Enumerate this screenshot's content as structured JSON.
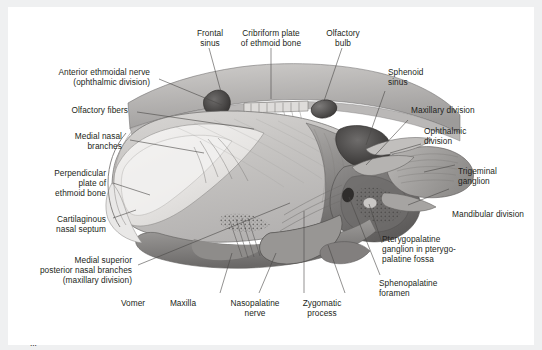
{
  "figure": {
    "type": "anatomical-illustration",
    "rendering": "grayscale medical line-and-wash drawing",
    "ink_color": "#3a3a3c",
    "line_color": "#5b5b5f",
    "page_background": "#eff0f1",
    "sheet_background": "#ffffff"
  },
  "labels": [
    {
      "id": "frontal-sinus",
      "text": "Frontal\nsinus",
      "align": "center"
    },
    {
      "id": "cribriform-plate",
      "text": "Cribriform plate\nof ethmoid bone",
      "align": "center"
    },
    {
      "id": "olfactory-bulb",
      "text": "Olfactory\nbulb",
      "align": "center"
    },
    {
      "id": "anterior-ethmoidal-nerve",
      "text": "Anterior ethmoidal nerve\n(ophthalmic division)",
      "align": "right"
    },
    {
      "id": "olfactory-fibers",
      "text": "Olfactory fibers",
      "align": "right"
    },
    {
      "id": "medial-nasal-branches",
      "text": "Medial nasal\nbranches",
      "align": "right"
    },
    {
      "id": "perpendicular-plate",
      "text": "Perpendicular\nplate of\nethmoid bone",
      "align": "right"
    },
    {
      "id": "cartilaginous-septum",
      "text": "Cartilaginous\nnasal septum",
      "align": "right"
    },
    {
      "id": "medial-superior-posterior",
      "text": "Medial superior\nposterior nasal branches\n(maxillary division)",
      "align": "right"
    },
    {
      "id": "vomer",
      "text": "Vomer",
      "align": "center"
    },
    {
      "id": "maxilla",
      "text": "Maxilla",
      "align": "center"
    },
    {
      "id": "nasopalatine-nerve",
      "text": "Nasopalatine\nnerve",
      "align": "center"
    },
    {
      "id": "zygomatic-process",
      "text": "Zygomatic\nprocess",
      "align": "center"
    },
    {
      "id": "sphenopalatine-foramen",
      "text": "Sphenopalatine\nforamen",
      "align": "left"
    },
    {
      "id": "pterygopalatine-ganglion",
      "text": "Pterygopalatine\nganglion in pterygo-\npalatine fossa",
      "align": "left"
    },
    {
      "id": "mandibular-division",
      "text": "Mandibular division",
      "align": "left"
    },
    {
      "id": "trigeminal-ganglion",
      "text": "Trigeminal\nganglion",
      "align": "left"
    },
    {
      "id": "ophthalmic-division",
      "text": "Ophthalmic\ndivision",
      "align": "left"
    },
    {
      "id": "maxillary-division",
      "text": "Maxillary division",
      "align": "left"
    },
    {
      "id": "sphenoid-sinus",
      "text": "Sphenoid\nsinus",
      "align": "left"
    }
  ],
  "caption": {
    "text": "  ..."
  }
}
